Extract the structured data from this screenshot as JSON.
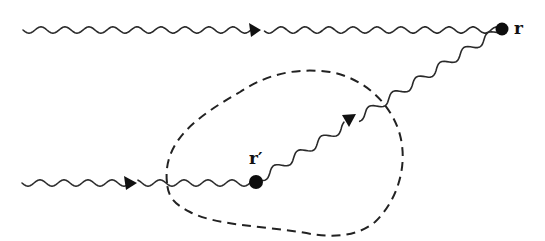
{
  "diagram": {
    "points": {
      "r": {
        "label": "r",
        "x": 502,
        "y": 29
      },
      "r_prime": {
        "label": "r′",
        "x": 256,
        "y": 182
      }
    },
    "paths": [
      {
        "id": "incoming-top",
        "description": "wavy line from left to r",
        "arrow_x": 255
      },
      {
        "id": "incoming-bottom",
        "description": "wavy line from left to r′",
        "arrow_x": 130
      },
      {
        "id": "scattered",
        "description": "wavy line from r′ to r",
        "arrow_at": [
          348,
          120
        ]
      }
    ],
    "region": {
      "style": "dashed closed curve enclosing r′"
    },
    "colors": {
      "line": "#2a2a2a",
      "dot": "#0d0d0d",
      "background": "#ffffff"
    }
  }
}
